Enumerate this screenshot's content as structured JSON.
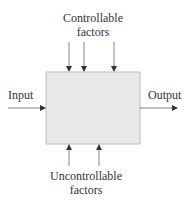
{
  "diagram": {
    "type": "process-block-diagram",
    "box_fill": "#e8e8e8",
    "box_stroke": "#bdbdbd",
    "arrow_color": "#555555",
    "top_label": [
      "Controllable",
      "factors"
    ],
    "bottom_label": [
      "Uncontrollable",
      "factors"
    ],
    "input_label": "Input",
    "output_label": "Output",
    "top_arrow_count": 3,
    "bottom_arrow_count": 2
  }
}
